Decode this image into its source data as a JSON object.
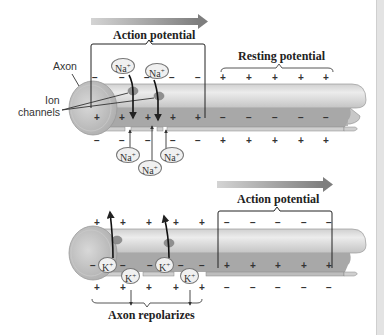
{
  "top_panel": {
    "direction_arrow": "arrow-right",
    "action_potential_label": "Action potential",
    "resting_potential_label": "Resting potential",
    "axon_label": "Axon",
    "ion_channels_label_line1": "Ion",
    "ion_channels_label_line2": "channels",
    "outside_signs_ap": [
      "−",
      "−",
      "−",
      "−",
      "−",
      "−"
    ],
    "outside_signs_rest": [
      "+",
      "+",
      "+",
      "+",
      "+"
    ],
    "inside_signs_ap": [
      "+",
      "+",
      "+",
      "+",
      "+",
      "+"
    ],
    "inside_signs_rest": [
      "−",
      "−",
      "−",
      "−",
      "−"
    ],
    "below_signs_ap": [
      "−",
      "−",
      "−",
      "−",
      "−",
      "−"
    ],
    "below_signs_rest": [
      "+",
      "+",
      "+",
      "+",
      "+"
    ],
    "ions_above": [
      {
        "symbol": "Na",
        "charge": "+"
      },
      {
        "symbol": "Na",
        "charge": "+"
      }
    ],
    "ions_below": [
      {
        "symbol": "Na",
        "charge": "+"
      },
      {
        "symbol": "Na",
        "charge": "+"
      },
      {
        "symbol": "Na",
        "charge": "+"
      }
    ]
  },
  "bottom_panel": {
    "direction_arrow": "arrow-right",
    "action_potential_label": "Action potential",
    "repolarizes_label": "Axon repolarizes",
    "outside_signs_left": [
      "+",
      "+",
      "+",
      "+",
      "+",
      "+"
    ],
    "outside_signs_ap": [
      "−",
      "−",
      "−",
      "−",
      "−"
    ],
    "inside_signs_left": [
      "−",
      "−",
      "−",
      "−",
      "−"
    ],
    "inside_signs_ap": [
      "+",
      "+",
      "+",
      "+",
      "+"
    ],
    "below_signs_left": [
      "+",
      "+",
      "+",
      "+",
      "+",
      "+"
    ],
    "below_signs_ap": [
      "−",
      "−",
      "−",
      "−",
      "−"
    ],
    "ions": [
      {
        "symbol": "K",
        "charge": "+"
      },
      {
        "symbol": "K",
        "charge": "+"
      },
      {
        "symbol": "K",
        "charge": "+"
      },
      {
        "symbol": "K",
        "charge": "+"
      }
    ]
  },
  "colors": {
    "axon_outer": "#d4d4d4",
    "axon_inner": "#a9a9a9",
    "axon_highlight": "#e9e9e9",
    "arrow_gradient_start": "#d0d0d0",
    "arrow_gradient_end": "#808080",
    "line": "#333333"
  }
}
